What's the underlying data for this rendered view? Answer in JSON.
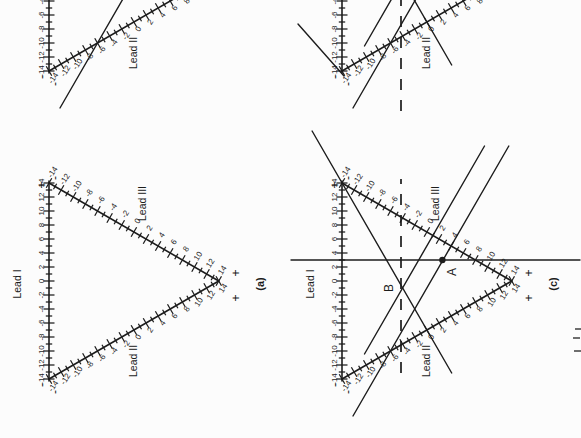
{
  "figure": {
    "bg_color": "#fcfcfc",
    "ink_color": "#1c1c1c",
    "leads": {
      "I": "Lead I",
      "II": "Lead II",
      "III": "Lead III"
    },
    "signs": {
      "plus": "+",
      "minus": "-"
    },
    "scale": {
      "min": -14,
      "max": 14,
      "tick_step": 1,
      "label_step": 2,
      "tick_labels": [
        "-14",
        "-12",
        "-10",
        "-8",
        "-6",
        "-4",
        "-2",
        "0",
        "2",
        "4",
        "6",
        "8",
        "10",
        "12",
        "14"
      ]
    },
    "points": {
      "A": {
        "label": "A",
        "lead_I_value": 3,
        "lead_III_value": 4
      },
      "B": {
        "label": "B"
      }
    },
    "panels": [
      {
        "id": "a",
        "caption": "(a)",
        "col": 0,
        "row": 0,
        "cut": false,
        "extras": []
      },
      {
        "id": "b",
        "caption": "",
        "col": 1,
        "row": 0,
        "cut": true,
        "extras": [
          "perp3_A"
        ]
      },
      {
        "id": "c",
        "caption": "(c)",
        "col": 0,
        "row": 1,
        "cut": false,
        "extras": [
          "lead1_perp",
          "dashed",
          "perp3_A",
          "perp3_B",
          "perp2_B",
          "pointA",
          "pointB"
        ]
      },
      {
        "id": "d",
        "caption": "",
        "col": 1,
        "row": 1,
        "cut": true,
        "extras": [
          "dashed_wide",
          "perp3_A",
          "perp3_B",
          "perp2_B",
          "corner_line"
        ]
      }
    ],
    "extra_defs": {
      "lead1_perp": {
        "type": "vline",
        "dx": 119,
        "y1o": -51,
        "y2o": 238
      },
      "dashed": {
        "type": "dhline",
        "dy": 59,
        "x1o": 6,
        "x2o": 200
      },
      "dashed_wide": {
        "type": "dhline",
        "dy": 59,
        "x1o": -40,
        "x2o": 200
      },
      "perp3_A": {
        "type": "line",
        "x1o": -37,
        "y1o": 11.0,
        "x2o": 233,
        "y2o": 166.8
      },
      "perp3_B": {
        "type": "line",
        "x1o": 25,
        "y1o": 22.5,
        "x2o": 233,
        "y2o": 142.5
      },
      "perp2_B": {
        "type": "line",
        "x1o": 6,
        "y1o": 109.7,
        "x2o": 248,
        "y2o": -29.9
      },
      "corner_line": {
        "type": "line",
        "x1o": -5,
        "y1o": 2,
        "x2o": 47,
        "y2o": -44
      },
      "pointA": {
        "type": "dot",
        "dx": 119,
        "dy": 100.4,
        "label_dx": 107,
        "label_dy": 114
      },
      "pointB": {
        "type": "label",
        "label_dx": 91,
        "label_dy": 51
      }
    },
    "geometry": {
      "page_w": 438,
      "page_h": 581,
      "cols": [
        59,
        367
      ],
      "rows": [
        49,
        342
      ],
      "unit": 7,
      "side": 196
    },
    "stray_marks": [
      {
        "x1": 87,
        "y1": 574,
        "x2": 87,
        "y2": 581
      },
      {
        "x1": 100,
        "y1": 573,
        "x2": 100,
        "y2": 580
      },
      {
        "x1": 109,
        "y1": 575,
        "x2": 109,
        "y2": 581
      }
    ]
  }
}
